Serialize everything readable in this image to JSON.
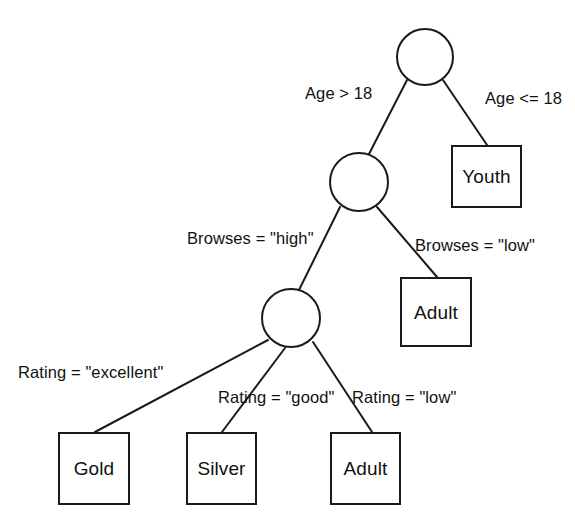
{
  "diagram": {
    "type": "decision-tree",
    "stroke_color": "#1a1a1a",
    "background_color": "#ffffff",
    "nodes": [
      {
        "id": "root",
        "shape": "circle",
        "label": "",
        "cx": 425,
        "cy": 57,
        "r": 29
      },
      {
        "id": "age",
        "shape": "circle",
        "label": "",
        "cx": 359,
        "cy": 182,
        "r": 30
      },
      {
        "id": "browses",
        "shape": "circle",
        "label": "",
        "cx": 291,
        "cy": 318,
        "r": 30
      }
    ],
    "leaves": [
      {
        "id": "youth",
        "label": "Youth",
        "x": 451,
        "y": 145,
        "w": 71,
        "h": 63
      },
      {
        "id": "adult-mid",
        "label": "Adult",
        "x": 400,
        "y": 277,
        "w": 72,
        "h": 70
      },
      {
        "id": "gold",
        "label": "Gold",
        "x": 58,
        "y": 432,
        "w": 72,
        "h": 73
      },
      {
        "id": "silver",
        "label": "Silver",
        "x": 186,
        "y": 432,
        "w": 71,
        "h": 73
      },
      {
        "id": "adult-bottom",
        "label": "Adult",
        "x": 330,
        "y": 432,
        "w": 71,
        "h": 73
      }
    ],
    "edges": [
      {
        "id": "root-to-age",
        "label": "Age > 18",
        "x1": 407,
        "y1": 80,
        "x2": 369,
        "y2": 154
      },
      {
        "id": "root-to-youth",
        "label": "Age <= 18",
        "x1": 443,
        "y1": 80,
        "x2": 487,
        "y2": 145
      },
      {
        "id": "age-to-browses",
        "label": "Browses = \"high\"",
        "x1": 340,
        "y1": 207,
        "x2": 299,
        "y2": 290
      },
      {
        "id": "age-to-adult-mid",
        "label": "Browses = \"low\"",
        "x1": 377,
        "y1": 207,
        "x2": 437,
        "y2": 277
      },
      {
        "id": "browses-to-gold",
        "label": "Rating = \"excellent\"",
        "x1": 268,
        "y1": 340,
        "x2": 95,
        "y2": 432
      },
      {
        "id": "browses-to-silver",
        "label": "Rating = \"good\"",
        "x1": 285,
        "y1": 348,
        "x2": 222,
        "y2": 432
      },
      {
        "id": "browses-to-adult",
        "label": "Rating = \"low\"",
        "x1": 313,
        "y1": 342,
        "x2": 372,
        "y2": 432
      }
    ],
    "edge_label_positions": [
      {
        "id": "label-age-gt",
        "text_ref": 0,
        "x": 305,
        "y": 85
      },
      {
        "id": "label-age-lte",
        "text_ref": 1,
        "x": 485,
        "y": 90
      },
      {
        "id": "label-browses-high",
        "text_ref": 2,
        "x": 187,
        "y": 230
      },
      {
        "id": "label-browses-low",
        "text_ref": 3,
        "x": 415,
        "y": 237
      },
      {
        "id": "label-rating-exc",
        "text_ref": 4,
        "x": 18,
        "y": 364
      },
      {
        "id": "label-rating-good",
        "text_ref": 5,
        "x": 218,
        "y": 389
      },
      {
        "id": "label-rating-low",
        "text_ref": 6,
        "x": 352,
        "y": 389
      }
    ]
  }
}
